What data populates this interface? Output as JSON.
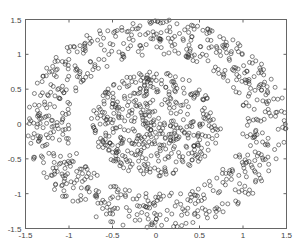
{
  "chart_data": {
    "type": "scatter",
    "title": "",
    "xlabel": "",
    "ylabel": "",
    "xlim": [
      -1.5,
      1.5
    ],
    "ylim": [
      -1.5,
      1.5
    ],
    "grid": false,
    "legend": null,
    "xticks": [
      "-1.5",
      "-1",
      "-0.5",
      "0",
      "0.5",
      "1",
      "1.5"
    ],
    "yticks": [
      "1.5",
      "1",
      "0.5",
      "0",
      "-0.5",
      "-1",
      "-1.5"
    ],
    "marker": "open-circle",
    "marker_color": "#333333",
    "series": [
      {
        "name": "inner-cluster",
        "shape": "disk",
        "center": [
          0,
          0
        ],
        "radius_range": [
          0,
          0.75
        ],
        "count": 450
      },
      {
        "name": "outer-ring",
        "shape": "annulus",
        "center": [
          0,
          0
        ],
        "radius_range": [
          1.0,
          1.5
        ],
        "count": 700
      }
    ]
  }
}
